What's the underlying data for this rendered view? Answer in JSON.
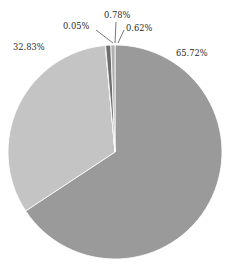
{
  "chart_data": {
    "type": "pie",
    "title": "",
    "subtitle": "",
    "xlabel": "",
    "ylabel": "",
    "legend_position": "none",
    "grid": false,
    "labels": [
      "65.72%",
      "0.05%",
      "0.78%",
      "0.62%",
      "32.83%"
    ],
    "categories": [
      "Slice 1",
      "Slice 2",
      "Slice 3",
      "Slice 4",
      "Slice 5"
    ],
    "values": [
      65.72,
      0.05,
      0.78,
      0.62,
      32.83
    ],
    "slices": [
      {
        "label": "65.72%",
        "value": 65.72,
        "color": "#9a9a9a",
        "start_angle_deg": 0,
        "end_angle_deg": 236.592,
        "label_x": 176,
        "label_y": 56,
        "label_anchor": "start",
        "has_leader": false
      },
      {
        "label": "32.83%",
        "value": 32.83,
        "color": "#c4c4c4",
        "start_angle_deg": 236.592,
        "end_angle_deg": 354.78,
        "label_x": 13,
        "label_y": 50,
        "label_anchor": "start",
        "has_leader": false
      },
      {
        "label": "0.05%",
        "value": 0.05,
        "color": "#7d7d7d",
        "start_angle_deg": 354.78,
        "end_angle_deg": 354.96,
        "label_x": 63,
        "label_y": 29,
        "label_anchor": "start",
        "has_leader": true,
        "leader_x1": 96,
        "leader_y1": 30,
        "leader_x2": 113,
        "leader_y2": 43
      },
      {
        "label": "0.78%",
        "value": 0.78,
        "color": "#6e6e6e",
        "start_angle_deg": 354.96,
        "end_angle_deg": 357.768,
        "label_x": 104,
        "label_y": 18,
        "label_anchor": "start",
        "has_leader": true,
        "leader_x1": 116,
        "leader_y1": 22,
        "leader_x2": 115,
        "leader_y2": 43
      },
      {
        "label": "0.62%",
        "value": 0.62,
        "color": "#b0b0b0",
        "start_angle_deg": 357.768,
        "end_angle_deg": 360,
        "label_x": 126,
        "label_y": 31,
        "label_anchor": "start",
        "has_leader": true,
        "leader_x1": 124,
        "leader_y1": 30,
        "leader_x2": 118,
        "leader_y2": 43
      }
    ],
    "geometry": {
      "center_x": 115,
      "center_y": 152,
      "radius": 107
    },
    "background_color": "#ffffff",
    "label_color": "#2b2b2b"
  }
}
